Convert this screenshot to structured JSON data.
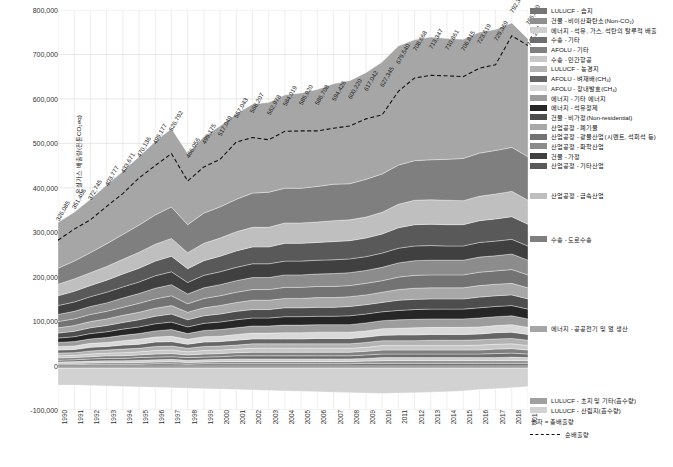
{
  "chart_data": {
    "type": "area",
    "title": "",
    "xlabel": "",
    "ylabel": "온실가스 배출량(천톤CO₂eq)",
    "ylim": [
      -100000,
      800000
    ],
    "yticks": [
      "800,000",
      "700,000",
      "600,000",
      "500,000",
      "400,000",
      "300,000",
      "200,000",
      "100,000",
      "0",
      "-100,000"
    ],
    "grid": true,
    "legend_position": "right",
    "categories": [
      1990,
      1991,
      1992,
      1993,
      1994,
      1995,
      1996,
      1997,
      1998,
      1999,
      2000,
      2001,
      2002,
      2003,
      2004,
      2005,
      2006,
      2007,
      2008,
      2009,
      2010,
      2011,
      2012,
      2013,
      2014,
      2015,
      2016,
      2017,
      2018,
      2019
    ],
    "x": [
      "1990",
      "1991",
      "1992",
      "1993",
      "1994",
      "1995",
      "1996",
      "1997",
      "1998",
      "1999",
      "2000",
      "2001",
      "2002",
      "2003",
      "2004",
      "2005",
      "2006",
      "2007",
      "2008",
      "2009",
      "2010",
      "2011",
      "2012",
      "2013",
      "2014",
      "2015",
      "2016",
      "2017",
      "2018",
      "2019"
    ],
    "total_labels": [
      "326,085",
      "351,406",
      "372,745",
      "403,777",
      "433,671",
      "470,136",
      "499,177",
      "526,792",
      "466,056",
      "499,175",
      "517,049",
      "557,043",
      "568,207",
      "562,978",
      "584,019",
      "585,920",
      "586,708",
      "594,426",
      "600,220",
      "617,042",
      "627,345",
      "679,540",
      "708,668",
      "713,347",
      "710,861",
      "706,815",
      "723,619",
      "729,369",
      "792,369",
      "766,670"
    ],
    "last_label": "747,264",
    "label_note": "숫자 = 총배출량",
    "netline_label": "순배출량",
    "series": [
      {
        "name": "에너지 - 공공전기 및 열 생산",
        "color": "#a6a6a6",
        "values": [
          103000,
          110000,
          120000,
          132000,
          142000,
          154000,
          165000,
          176000,
          160000,
          172000,
          182000,
          192000,
          200000,
          202000,
          210000,
          214000,
          218000,
          226000,
          232000,
          240000,
          252000,
          268000,
          272000,
          276000,
          272000,
          268000,
          272000,
          272000,
          280000,
          265000
        ]
      },
      {
        "name": "수송 - 도로수송",
        "color": "#7f7f7f",
        "values": [
          36000,
          40000,
          45000,
          51000,
          56000,
          61000,
          66000,
          71000,
          63000,
          68000,
          70000,
          73000,
          77000,
          79000,
          78000,
          78000,
          80000,
          82000,
          81000,
          85000,
          86000,
          88000,
          89000,
          90000,
          92000,
          95000,
          97000,
          98000,
          99000,
          98000
        ]
      },
      {
        "name": "산업공정 - 금속산업",
        "color": "#bfbfbf",
        "values": [
          26000,
          28000,
          29000,
          31000,
          33000,
          36000,
          38000,
          40000,
          36000,
          39000,
          41000,
          43000,
          44000,
          44000,
          46000,
          46000,
          46000,
          47000,
          47000,
          47000,
          49000,
          53000,
          55000,
          55000,
          55000,
          54000,
          55000,
          56000,
          57000,
          54000
        ]
      },
      {
        "name": "산업공정 - 기타산업",
        "color": "#595959",
        "values": [
          22000,
          24000,
          25000,
          27000,
          29000,
          31000,
          33000,
          35000,
          31000,
          33000,
          35000,
          37000,
          38000,
          38000,
          40000,
          40000,
          40000,
          41000,
          41000,
          42000,
          43000,
          46000,
          48000,
          48000,
          48000,
          48000,
          49000,
          50000,
          51000,
          49000
        ]
      },
      {
        "name": "건물 - 가정",
        "color": "#404040",
        "values": [
          20000,
          21000,
          22000,
          24000,
          25000,
          26000,
          28000,
          29000,
          26000,
          28000,
          29000,
          30000,
          31000,
          31000,
          31000,
          31000,
          31000,
          31000,
          31000,
          31000,
          32000,
          33000,
          33000,
          33000,
          32000,
          32000,
          33000,
          33000,
          33000,
          32000
        ]
      },
      {
        "name": "산업공정 - 화학산업",
        "color": "#8c8c8c",
        "values": [
          16000,
          17000,
          18000,
          19000,
          21000,
          22000,
          24000,
          25000,
          22000,
          24000,
          25000,
          26000,
          27000,
          27000,
          28000,
          28000,
          28000,
          29000,
          29000,
          29000,
          30000,
          32000,
          33000,
          33000,
          33000,
          33000,
          34000,
          34000,
          35000,
          33000
        ]
      },
      {
        "name": "산업공정 - 광물산업(시멘트, 석회석 등)",
        "color": "#737373",
        "values": [
          14000,
          15000,
          16000,
          17000,
          18000,
          20000,
          21000,
          22000,
          19000,
          21000,
          22000,
          23000,
          24000,
          24000,
          25000,
          25000,
          25000,
          25000,
          25000,
          26000,
          26000,
          28000,
          29000,
          29000,
          29000,
          29000,
          30000,
          30000,
          31000,
          29000
        ]
      },
      {
        "name": "산업공정 - 폐기물",
        "color": "#a8a8a8",
        "values": [
          12000,
          13000,
          14000,
          15000,
          16000,
          17000,
          18000,
          19000,
          17000,
          18000,
          19000,
          20000,
          21000,
          21000,
          21000,
          21000,
          22000,
          22000,
          22000,
          22000,
          23000,
          24000,
          25000,
          25000,
          25000,
          25000,
          26000,
          26000,
          26000,
          25000
        ]
      },
      {
        "name": "건물 - 비가정(Non-residential)",
        "color": "#4d4d4d",
        "values": [
          11000,
          12000,
          13000,
          14000,
          15000,
          16000,
          17000,
          18000,
          16000,
          17000,
          18000,
          19000,
          19000,
          19000,
          20000,
          20000,
          20000,
          20000,
          21000,
          21000,
          21000,
          23000,
          23000,
          23000,
          23000,
          23000,
          24000,
          24000,
          24000,
          23000
        ]
      },
      {
        "name": "에너지 - 석유정제",
        "color": "#262626",
        "values": [
          10000,
          11000,
          12000,
          13000,
          14000,
          15000,
          16000,
          17000,
          15000,
          16000,
          17000,
          18000,
          18000,
          18000,
          19000,
          19000,
          19000,
          19000,
          20000,
          20000,
          20000,
          21000,
          22000,
          22000,
          22000,
          22000,
          23000,
          23000,
          23000,
          22000
        ]
      },
      {
        "name": "에너지 - 기타 에너지",
        "color": "#9c9c9c",
        "values": [
          9000,
          10000,
          10000,
          11000,
          12000,
          13000,
          14000,
          15000,
          13000,
          14000,
          15000,
          15000,
          16000,
          16000,
          17000,
          17000,
          17000,
          17000,
          17000,
          18000,
          18000,
          19000,
          19000,
          19000,
          19000,
          19000,
          20000,
          20000,
          20000,
          19000
        ]
      },
      {
        "name": "AFOLU - 장내발효(CH₄)",
        "color": "#d9d9d9",
        "values": [
          8000,
          8000,
          9000,
          9000,
          10000,
          11000,
          11000,
          12000,
          11000,
          12000,
          12000,
          13000,
          13000,
          13000,
          14000,
          14000,
          14000,
          14000,
          14000,
          14000,
          15000,
          15000,
          16000,
          16000,
          16000,
          16000,
          16000,
          16000,
          17000,
          16000
        ]
      },
      {
        "name": "AFOLU - 벼재배(CH₄)",
        "color": "#666666",
        "values": [
          7000,
          7000,
          8000,
          8000,
          9000,
          9000,
          10000,
          10000,
          9000,
          10000,
          10000,
          11000,
          11000,
          11000,
          11000,
          11000,
          12000,
          12000,
          12000,
          12000,
          12000,
          13000,
          13000,
          13000,
          13000,
          13000,
          13000,
          14000,
          14000,
          13000
        ]
      },
      {
        "name": "LULUCF - 농경지",
        "color": "#b3b3b3",
        "values": [
          6000,
          6000,
          7000,
          7000,
          8000,
          8000,
          9000,
          9000,
          8000,
          9000,
          9000,
          9000,
          10000,
          10000,
          10000,
          10000,
          10000,
          10000,
          10000,
          11000,
          11000,
          11000,
          11000,
          12000,
          12000,
          12000,
          12000,
          12000,
          12000,
          12000
        ]
      },
      {
        "name": "수송 - 민간항공",
        "color": "#c8c8c8",
        "values": [
          5000,
          5000,
          6000,
          6000,
          7000,
          7000,
          8000,
          8000,
          7000,
          8000,
          8000,
          8000,
          9000,
          9000,
          9000,
          9000,
          9000,
          9000,
          9000,
          9000,
          10000,
          10000,
          10000,
          10000,
          10000,
          10000,
          11000,
          11000,
          11000,
          10000
        ]
      },
      {
        "name": "AFOLU - 기타",
        "color": "#808080",
        "values": [
          5000,
          5000,
          5000,
          6000,
          6000,
          6000,
          7000,
          7000,
          6000,
          7000,
          7000,
          7000,
          8000,
          8000,
          8000,
          8000,
          8000,
          8000,
          8000,
          8000,
          9000,
          9000,
          9000,
          9000,
          9000,
          9000,
          9000,
          10000,
          10000,
          9000
        ]
      },
      {
        "name": "수송 - 기타",
        "color": "#6e6e6e",
        "values": [
          4000,
          4000,
          5000,
          5000,
          5000,
          6000,
          6000,
          6000,
          6000,
          6000,
          6000,
          7000,
          7000,
          7000,
          7000,
          7000,
          7000,
          7000,
          7000,
          8000,
          8000,
          8000,
          8000,
          8000,
          8000,
          8000,
          8000,
          9000,
          9000,
          8000
        ]
      },
      {
        "name": "에너지 - 석유, 가스, 석탄의 탈루적 배출",
        "color": "#cfcfcf",
        "values": [
          3000,
          4000,
          4000,
          4000,
          4000,
          5000,
          5000,
          5000,
          5000,
          5000,
          5000,
          6000,
          6000,
          6000,
          6000,
          6000,
          6000,
          6000,
          6000,
          6000,
          7000,
          7000,
          7000,
          7000,
          7000,
          7000,
          7000,
          7000,
          8000,
          7000
        ]
      },
      {
        "name": "건물 - 비이산화탄소(Non-CO₂)",
        "color": "#8f8f8f",
        "values": [
          3000,
          3000,
          3000,
          4000,
          4000,
          4000,
          4000,
          5000,
          4000,
          4000,
          5000,
          5000,
          5000,
          5000,
          5000,
          5000,
          5000,
          5000,
          5000,
          5000,
          6000,
          6000,
          6000,
          6000,
          6000,
          6000,
          6000,
          6000,
          6000,
          6000
        ]
      },
      {
        "name": "LULUCF - 습지",
        "color": "#757575",
        "values": [
          2000,
          2000,
          3000,
          3000,
          3000,
          3000,
          4000,
          4000,
          3000,
          4000,
          4000,
          4000,
          4000,
          4000,
          4000,
          4000,
          4000,
          4000,
          4000,
          5000,
          5000,
          5000,
          5000,
          5000,
          5000,
          5000,
          5000,
          5000,
          5000,
          5000
        ]
      }
    ],
    "sink_series": [
      {
        "name": "LULUCF - 초지 및 기타(흡수량)",
        "color": "#a0a0a0",
        "values": [
          -6000,
          -6000,
          -6000,
          -6000,
          -6000,
          -6000,
          -6000,
          -6000,
          -6000,
          -6000,
          -6000,
          -6000,
          -6000,
          -6000,
          -6000,
          -6000,
          -6000,
          -6000,
          -6000,
          -6000,
          -6000,
          -6000,
          -6000,
          -6000,
          -6000,
          -6000,
          -6000,
          -6000,
          -6000,
          -6000
        ]
      },
      {
        "name": "LULUCF - 산림지(흡수량)",
        "color": "#d2d2d2",
        "values": [
          -38000,
          -38000,
          -39000,
          -40000,
          -41000,
          -42000,
          -43000,
          -44000,
          -45000,
          -46000,
          -47000,
          -48000,
          -49000,
          -50000,
          -51000,
          -52000,
          -53000,
          -54000,
          -55000,
          -56000,
          -57000,
          -56000,
          -55000,
          -54000,
          -53000,
          -51000,
          -48000,
          -46000,
          -44000,
          -41000
        ]
      }
    ],
    "net_values": [
      282000,
      307000,
      328000,
      358000,
      387000,
      422000,
      450000,
      477000,
      415000,
      447000,
      464000,
      503000,
      513000,
      508000,
      527000,
      528000,
      528000,
      534000,
      539000,
      555000,
      564000,
      617000,
      647000,
      653000,
      652000,
      650000,
      669000,
      677000,
      742000,
      720000
    ]
  },
  "legend": {
    "main_items": [
      {
        "label": "LULUCF - 습지",
        "color": "#757575"
      },
      {
        "label": "건물 - 비이산화탄소(Non-CO₂)",
        "color": "#8f8f8f"
      },
      {
        "label": "에너지 - 석유, 가스, 석탄의 탈루적 배출",
        "color": "#cfcfcf"
      },
      {
        "label": "수송 - 기타",
        "color": "#6e6e6e"
      },
      {
        "label": "AFOLU - 기타",
        "color": "#808080"
      },
      {
        "label": "수송 - 민간항공",
        "color": "#c8c8c8"
      },
      {
        "label": "LULUCF - 농경지",
        "color": "#b3b3b3"
      },
      {
        "label": "AFOLU - 벼재배(CH₄)",
        "color": "#666666"
      },
      {
        "label": "AFOLU - 장내발효(CH₄)",
        "color": "#d9d9d9"
      },
      {
        "label": "에너지 - 기타 에너지",
        "color": "#9c9c9c"
      },
      {
        "label": "에너지 - 석유정제",
        "color": "#262626"
      },
      {
        "label": "건물 - 비가정(Non-residential)",
        "color": "#4d4d4d"
      },
      {
        "label": "산업공정 - 폐기물",
        "color": "#a8a8a8"
      },
      {
        "label": "산업공정 - 광물산업(시멘트, 석회석 등)",
        "color": "#737373"
      },
      {
        "label": "산업공정 - 화학산업",
        "color": "#8c8c8c"
      },
      {
        "label": "건물 - 가정",
        "color": "#404040"
      },
      {
        "label": "산업공정 - 기타산업",
        "color": "#595959"
      }
    ],
    "metal_item": {
      "label": "산업공정 - 금속산업",
      "color": "#bfbfbf"
    },
    "road_item": {
      "label": "수송 - 도로수송",
      "color": "#7f7f7f"
    },
    "power_item": {
      "label": "에너지 - 공공전기 및 열 생산",
      "color": "#a6a6a6"
    },
    "sink_items": [
      {
        "label": "LULUCF - 초지 및 기타(흡수량)",
        "color": "#a0a0a0"
      },
      {
        "label": "LULUCF - 산림지(흡수량)",
        "color": "#d2d2d2"
      }
    ],
    "number_note": "숫자 = 총배출량",
    "net_note": "순배출량"
  }
}
